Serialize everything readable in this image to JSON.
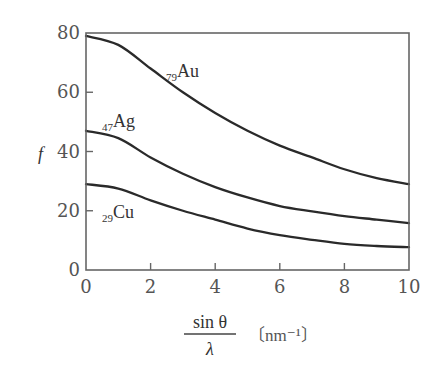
{
  "chart_data": {
    "type": "line",
    "title": "",
    "xlabel": "sin θ / λ",
    "xlabel_numerator": "sin θ",
    "xlabel_denominator": "λ",
    "xlabel_unit": "〔nm⁻¹〕",
    "ylabel": "f",
    "xlim": [
      0,
      10
    ],
    "ylim": [
      0,
      80
    ],
    "x_ticks": [
      0,
      2,
      4,
      6,
      8,
      10
    ],
    "y_ticks": [
      0,
      20,
      40,
      60,
      80
    ],
    "grid": false,
    "legend": "inline labels",
    "x": [
      0,
      1,
      2,
      3,
      4,
      5,
      6,
      7,
      8,
      9,
      10
    ],
    "series": [
      {
        "name": "79Au",
        "subscript": "79",
        "symbol": "Au",
        "values": [
          79,
          76,
          68,
          60,
          53,
          47,
          42,
          38,
          34,
          31,
          29
        ]
      },
      {
        "name": "47Ag",
        "subscript": "47",
        "symbol": "Ag",
        "values": [
          47,
          44.5,
          38,
          32.5,
          28,
          24.5,
          21.6,
          19.8,
          18.2,
          17,
          15.8
        ]
      },
      {
        "name": "29Cu",
        "subscript": "29",
        "symbol": "Cu",
        "values": [
          29,
          27.5,
          23.5,
          20,
          17,
          14,
          11.8,
          10.2,
          8.8,
          8.1,
          7.7
        ]
      }
    ]
  }
}
